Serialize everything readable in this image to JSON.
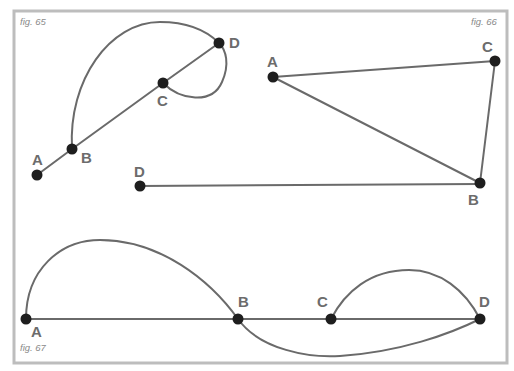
{
  "figures": [
    {
      "caption": "fig. 65",
      "nodes": [
        {
          "id": "A",
          "label": "A"
        },
        {
          "id": "B",
          "label": "B"
        },
        {
          "id": "C",
          "label": "C"
        },
        {
          "id": "D",
          "label": "D"
        }
      ],
      "edges": [
        {
          "from": "A",
          "to": "B",
          "kind": "straight"
        },
        {
          "from": "B",
          "to": "C",
          "kind": "straight"
        },
        {
          "from": "C",
          "to": "D",
          "kind": "straight"
        },
        {
          "from": "B",
          "to": "D",
          "kind": "curved"
        },
        {
          "from": "C",
          "to": "D",
          "kind": "curved"
        }
      ]
    },
    {
      "caption": "fig. 66",
      "nodes": [
        {
          "id": "A",
          "label": "A"
        },
        {
          "id": "B",
          "label": "B"
        },
        {
          "id": "C",
          "label": "C"
        },
        {
          "id": "D",
          "label": "D"
        }
      ],
      "edges": [
        {
          "from": "A",
          "to": "C",
          "kind": "straight"
        },
        {
          "from": "A",
          "to": "B",
          "kind": "straight"
        },
        {
          "from": "C",
          "to": "B",
          "kind": "straight"
        },
        {
          "from": "D",
          "to": "B",
          "kind": "straight"
        }
      ]
    },
    {
      "caption": "fig. 67",
      "nodes": [
        {
          "id": "A",
          "label": "A"
        },
        {
          "id": "B",
          "label": "B"
        },
        {
          "id": "C",
          "label": "C"
        },
        {
          "id": "D",
          "label": "D"
        }
      ],
      "edges": [
        {
          "from": "A",
          "to": "B",
          "kind": "straight"
        },
        {
          "from": "B",
          "to": "C",
          "kind": "straight"
        },
        {
          "from": "C",
          "to": "D",
          "kind": "straight"
        },
        {
          "from": "A",
          "to": "B",
          "kind": "curved"
        },
        {
          "from": "B",
          "to": "D",
          "kind": "curved"
        },
        {
          "from": "C",
          "to": "D",
          "kind": "curved"
        }
      ]
    }
  ]
}
